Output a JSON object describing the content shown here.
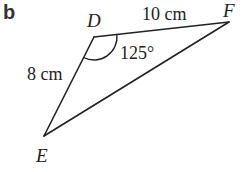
{
  "part_label": "b",
  "vertices": {
    "D": {
      "label": "D",
      "x": 94,
      "y": 37
    },
    "F": {
      "label": "F",
      "x": 229,
      "y": 22
    },
    "E": {
      "label": "E",
      "x": 44,
      "y": 136
    }
  },
  "sides": {
    "DF": {
      "label": "10 cm"
    },
    "DE": {
      "label": "8 cm"
    }
  },
  "angle_D": {
    "label": "125°"
  }
}
